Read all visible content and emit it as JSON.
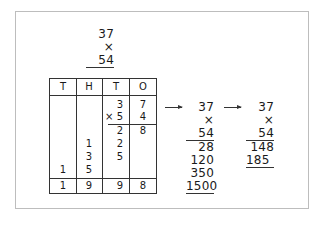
{
  "problem": {
    "multiplicand": "37",
    "multiplier": "× 54"
  },
  "place_value_table": {
    "headers": [
      "T",
      "H",
      "T",
      "O"
    ],
    "rows": [
      {
        "T": "",
        "H": "",
        "t": "3",
        "O": "7"
      },
      {
        "T": "",
        "H": "",
        "t": "× 5",
        "O": "4"
      },
      {
        "T": "",
        "H": "",
        "t": "2",
        "O": "8"
      },
      {
        "T": "",
        "H": "1",
        "t": "2",
        "O": ""
      },
      {
        "T": "",
        "H": "3",
        "t": "5",
        "O": ""
      },
      {
        "T": "1",
        "H": "5",
        "t": "",
        "O": ""
      }
    ],
    "total": {
      "T": "1",
      "H": "9",
      "t": "9",
      "O": "8"
    }
  },
  "expanded_method": {
    "multiplicand": "37",
    "multiplier": "× 54",
    "partials": [
      "28",
      "120",
      "350",
      "1500"
    ]
  },
  "compact_method": {
    "multiplicand": "37",
    "multiplier": "× 54",
    "partials": [
      "148",
      "185"
    ]
  }
}
